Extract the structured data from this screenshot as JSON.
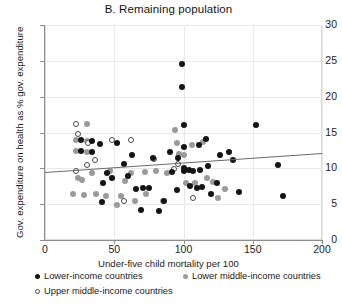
{
  "chart_data": {
    "type": "scatter",
    "title": "B. Remaining population",
    "xlabel": "Under-five child mortality per 100",
    "ylabel": "Gov. expenditure on health as % gov. expenditure",
    "xlim": [
      0,
      200
    ],
    "ylim": [
      0,
      30
    ],
    "xticks": [
      "0",
      "50",
      "100",
      "150",
      "200"
    ],
    "yticks": [
      "0",
      "5",
      "10",
      "15",
      "20",
      "25",
      "30"
    ],
    "grid": true,
    "legend_position": "below-axes",
    "series": [
      {
        "name": "Lower-income countries",
        "key": "low",
        "marker": "filled-circle",
        "color": "#141414",
        "points": [
          [
            26,
            13.9
          ],
          [
            34,
            13.8
          ],
          [
            26,
            12.4
          ],
          [
            34,
            12.3
          ],
          [
            40,
            13.4
          ],
          [
            52,
            13.6
          ],
          [
            45,
            9.3
          ],
          [
            42,
            8.0
          ],
          [
            48,
            8.6
          ],
          [
            41,
            5.3
          ],
          [
            57,
            10.6
          ],
          [
            60,
            9.0
          ],
          [
            66,
            7.1
          ],
          [
            71,
            7.2
          ],
          [
            75,
            7.3
          ],
          [
            69,
            4.2
          ],
          [
            63,
            11.9
          ],
          [
            78,
            11.5
          ],
          [
            86,
            5.4
          ],
          [
            90,
            12.3
          ],
          [
            96,
            11.4
          ],
          [
            99,
            24.5
          ],
          [
            99,
            21.4
          ],
          [
            100,
            16.0
          ],
          [
            100,
            13.0
          ],
          [
            100,
            10.0
          ],
          [
            100,
            9.6
          ],
          [
            104,
            9.8
          ],
          [
            107,
            9.7
          ],
          [
            111,
            13.3
          ],
          [
            112,
            9.8
          ],
          [
            116,
            14.1
          ],
          [
            118,
            10.3
          ],
          [
            105,
            7.5
          ],
          [
            110,
            7.2
          ],
          [
            113,
            7.4
          ],
          [
            120,
            6.4
          ],
          [
            124,
            8.0
          ],
          [
            126,
            11.9
          ],
          [
            133,
            12.3
          ],
          [
            136,
            11.1
          ],
          [
            140,
            6.7
          ],
          [
            152,
            16.1
          ],
          [
            168,
            10.5
          ],
          [
            172,
            6.2
          ],
          [
            82,
            4.0
          ],
          [
            95,
            7.0
          ],
          [
            92,
            9.5
          ]
        ]
      },
      {
        "name": "Lower middle-income countries",
        "key": "lowmid",
        "marker": "filled-circle",
        "color": "#9a9a9a",
        "points": [
          [
            30,
            16.2
          ],
          [
            22,
            13.9
          ],
          [
            30,
            13.8
          ],
          [
            22,
            12.4
          ],
          [
            30,
            12.3
          ],
          [
            24,
            8.7
          ],
          [
            27,
            8.4
          ],
          [
            34,
            9.3
          ],
          [
            20,
            6.4
          ],
          [
            28,
            6.3
          ],
          [
            37,
            6.4
          ],
          [
            44,
            6.2
          ],
          [
            55,
            6.2
          ],
          [
            62,
            9.4
          ],
          [
            58,
            8.2
          ],
          [
            72,
            9.5
          ],
          [
            80,
            9.6
          ],
          [
            73,
            6.4
          ],
          [
            88,
            9.3
          ],
          [
            94,
            15.4
          ],
          [
            97,
            12.0
          ],
          [
            100,
            11.8
          ],
          [
            102,
            8.0
          ],
          [
            108,
            7.9
          ],
          [
            117,
            8.6
          ],
          [
            121,
            8.1
          ],
          [
            130,
            7.1
          ],
          [
            125,
            5.9
          ],
          [
            85,
            5.5
          ],
          [
            65,
            5.4
          ],
          [
            52,
            4.9
          ],
          [
            47,
            9.6
          ],
          [
            114,
            13.7
          ],
          [
            106,
            13.3
          ],
          [
            95,
            13.5
          ]
        ]
      },
      {
        "name": "Upper middle-income countries",
        "key": "upmid",
        "marker": "open-circle",
        "color": "#ffffff",
        "points": [
          [
            22,
            16.2
          ],
          [
            24,
            14.8
          ],
          [
            31,
            13.6
          ],
          [
            30,
            10.5
          ],
          [
            22,
            9.7
          ],
          [
            48,
            14.0
          ],
          [
            36,
            11.2
          ],
          [
            62,
            13.9
          ],
          [
            79,
            11.3
          ],
          [
            93,
            9.9
          ],
          [
            57,
            5.4
          ],
          [
            107,
            5.9
          ],
          [
            96,
            10.6
          ]
        ]
      }
    ],
    "trendline": {
      "name": "linear-fit",
      "x0": 0,
      "y0": 9.55,
      "x1": 200,
      "y1": 12.2,
      "color": "#6b6b6b"
    }
  },
  "legend": {
    "items": [
      {
        "label": "Lower-income countries",
        "key": "low"
      },
      {
        "label": "Lower middle-income countries",
        "key": "lowmid"
      },
      {
        "label": "Upper middle-income countries",
        "key": "upmid"
      }
    ]
  }
}
